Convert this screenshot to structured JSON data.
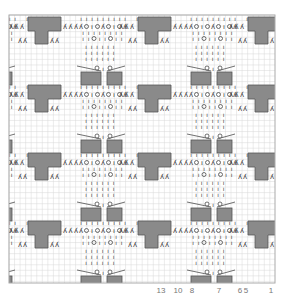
{
  "chart_data": {
    "type": "knitting-chart",
    "title": "",
    "grid": {
      "on": true,
      "x0": 9,
      "y0": 15,
      "width": 266,
      "height": 268,
      "cell": 5.55,
      "line_color": "#d8d8d8",
      "border_color": "#aaaaaa"
    },
    "colors": {
      "block_fill": "#8a8a8a",
      "block_stroke": "#555555",
      "symbol": "#333333"
    },
    "repeat": {
      "dx": 110,
      "dy": 68
    },
    "column_labels": [
      {
        "text": "13",
        "x": 161
      },
      {
        "text": "10",
        "x": 178
      },
      {
        "text": "8",
        "x": 192
      },
      {
        "text": "7",
        "x": 219
      },
      {
        "text": "6",
        "x": 240
      },
      {
        "text": "5",
        "x": 246
      },
      {
        "text": "1",
        "x": 271
      }
    ],
    "legend": [
      {
        "symbol": "|",
        "meaning": "knit"
      },
      {
        "symbol": "O",
        "meaning": "yarn over"
      },
      {
        "symbol": "ʎ",
        "meaning": "decrease"
      },
      {
        "symbol": "gray block",
        "meaning": "no stitch"
      }
    ],
    "lace_row_text": "ʎʎʎʎO|OʎO|Oʎʎʎ",
    "rows_repeat": 4,
    "cols_repeat": 2
  }
}
